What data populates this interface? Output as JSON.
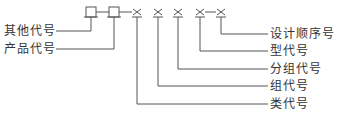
{
  "diagram": {
    "type": "code-structure",
    "symbols": [
      {
        "kind": "box",
        "x": 91
      },
      {
        "kind": "box",
        "x": 114
      },
      {
        "kind": "cross",
        "x": 137
      },
      {
        "kind": "cross",
        "x": 158
      },
      {
        "kind": "cross",
        "x": 178
      },
      {
        "kind": "cross",
        "x": 200
      },
      {
        "kind": "cross",
        "x": 221
      }
    ],
    "left_labels": [
      {
        "text": "其他代号",
        "symbol": 0
      },
      {
        "text": "产品代号",
        "symbol": 1
      }
    ],
    "right_labels": [
      {
        "text": "设计顺序号",
        "symbol": 6
      },
      {
        "text": "型代号",
        "symbol": 5
      },
      {
        "text": "分组代号",
        "symbol": 4
      },
      {
        "text": "组代号",
        "symbol": 3
      },
      {
        "text": "类代号",
        "symbol": 2
      }
    ],
    "line_color": "#555555"
  }
}
